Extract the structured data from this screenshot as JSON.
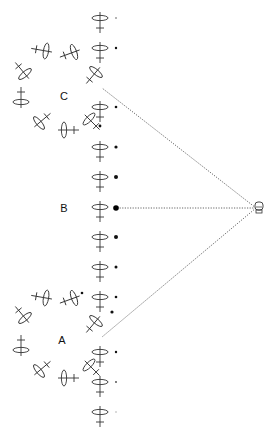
{
  "labels": {
    "A": {
      "text": "A",
      "x": 62,
      "y": 340
    },
    "B": {
      "text": "B",
      "x": 64,
      "y": 208
    },
    "C": {
      "text": "C",
      "x": 64,
      "y": 96
    }
  },
  "observer": {
    "name": "eye",
    "x": 259,
    "y": 208
  },
  "sight_lines": [
    {
      "from": [
        256,
        208
      ],
      "to": [
        102,
        88
      ]
    },
    {
      "from": [
        256,
        208
      ],
      "to": [
        117,
        208
      ]
    },
    {
      "from": [
        256,
        208
      ],
      "to": [
        102,
        337
      ]
    }
  ],
  "column_glyphs": [
    {
      "x": 100,
      "y": 18,
      "angle": 0
    },
    {
      "x": 100,
      "y": 48,
      "angle": 0
    },
    {
      "x": 100,
      "y": 107,
      "angle": 0
    },
    {
      "x": 100,
      "y": 147,
      "angle": 0
    },
    {
      "x": 100,
      "y": 177,
      "angle": 0
    },
    {
      "x": 100,
      "y": 207,
      "angle": 0
    },
    {
      "x": 100,
      "y": 237,
      "angle": 0
    },
    {
      "x": 100,
      "y": 267,
      "angle": 0
    },
    {
      "x": 100,
      "y": 297,
      "angle": 0
    },
    {
      "x": 100,
      "y": 352,
      "angle": 0
    },
    {
      "x": 100,
      "y": 382,
      "angle": 0
    },
    {
      "x": 100,
      "y": 412,
      "angle": 0
    }
  ],
  "ring_C": [
    {
      "x": 96,
      "y": 72,
      "angle": 40
    },
    {
      "x": 74,
      "y": 52,
      "angle": 70
    },
    {
      "x": 46,
      "y": 51,
      "angle": 100
    },
    {
      "x": 25,
      "y": 74,
      "angle": 140
    },
    {
      "x": 21,
      "y": 102,
      "angle": 180
    },
    {
      "x": 39,
      "y": 123,
      "angle": 230
    },
    {
      "x": 64,
      "y": 130,
      "angle": 270
    },
    {
      "x": 89,
      "y": 119,
      "angle": 315
    }
  ],
  "ring_A": [
    {
      "x": 96,
      "y": 321,
      "angle": 40
    },
    {
      "x": 74,
      "y": 298,
      "angle": 70
    },
    {
      "x": 46,
      "y": 298,
      "angle": 100
    },
    {
      "x": 25,
      "y": 318,
      "angle": 140
    },
    {
      "x": 21,
      "y": 350,
      "angle": 180
    },
    {
      "x": 39,
      "y": 371,
      "angle": 230
    },
    {
      "x": 64,
      "y": 378,
      "angle": 270
    },
    {
      "x": 89,
      "y": 365,
      "angle": 315
    }
  ],
  "dots": [
    {
      "x": 116,
      "y": 18,
      "r": 0.8,
      "color": "#555555"
    },
    {
      "x": 116,
      "y": 48,
      "r": 1.2,
      "color": "#111111"
    },
    {
      "x": 116,
      "y": 107,
      "r": 1.3,
      "color": "#111111"
    },
    {
      "x": 100,
      "y": 126,
      "r": 1.4,
      "color": "#111111"
    },
    {
      "x": 116,
      "y": 147,
      "r": 1.6,
      "color": "#111111"
    },
    {
      "x": 116,
      "y": 177,
      "r": 2.0,
      "color": "#111111"
    },
    {
      "x": 116,
      "y": 208,
      "r": 2.8,
      "color": "#000000"
    },
    {
      "x": 116,
      "y": 237,
      "r": 2.0,
      "color": "#111111"
    },
    {
      "x": 116,
      "y": 267,
      "r": 1.5,
      "color": "#111111"
    },
    {
      "x": 82,
      "y": 293,
      "r": 1.3,
      "color": "#111111"
    },
    {
      "x": 116,
      "y": 297,
      "r": 1.3,
      "color": "#111111"
    },
    {
      "x": 112,
      "y": 312,
      "r": 1.6,
      "color": "#111111"
    },
    {
      "x": 116,
      "y": 352,
      "r": 1.2,
      "color": "#111111"
    },
    {
      "x": 116,
      "y": 382,
      "r": 0.9,
      "color": "#444444"
    },
    {
      "x": 116,
      "y": 412,
      "r": 0.8,
      "color": "#aaaaaa"
    }
  ],
  "colors": {
    "stroke": "#333333",
    "line": "#555555",
    "background": "#ffffff"
  }
}
